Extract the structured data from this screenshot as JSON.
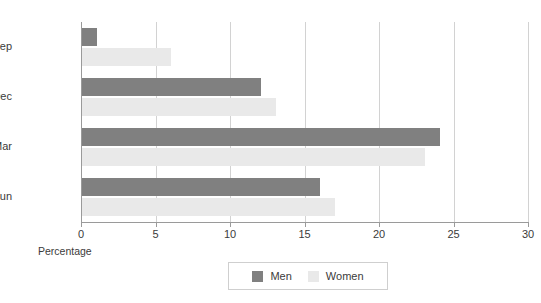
{
  "chart_data": {
    "type": "bar",
    "orientation": "horizontal",
    "title": "",
    "xlabel": "Percentage",
    "ylabel": "",
    "xlim": [
      0,
      30
    ],
    "xticks": [
      0,
      5,
      10,
      15,
      20,
      25,
      30
    ],
    "xtick_labels": [
      "0",
      "5",
      "10",
      "15",
      "20",
      "25",
      "30"
    ],
    "grid": true,
    "grid_axis": "x",
    "legend_position": "bottom-center",
    "categories": [
      "Jul to Sep",
      "Oct to Dec",
      "Jan to Mar",
      "Apr to Jun"
    ],
    "series": [
      {
        "name": "Men",
        "color": "#808080",
        "values": [
          1,
          12,
          24,
          16
        ]
      },
      {
        "name": "Women",
        "color": "#e9e9e9",
        "values": [
          6,
          13,
          23,
          17
        ]
      }
    ]
  },
  "legend": {
    "items": [
      {
        "label": "Men",
        "color": "#808080"
      },
      {
        "label": "Women",
        "color": "#e9e9e9"
      }
    ]
  },
  "colors": {
    "men": "#808080",
    "women": "#e9e9e9",
    "axis": "#9a9a9a",
    "grid": "#d2d2d2",
    "text": "#3b3b3b",
    "background": "#ffffff"
  }
}
